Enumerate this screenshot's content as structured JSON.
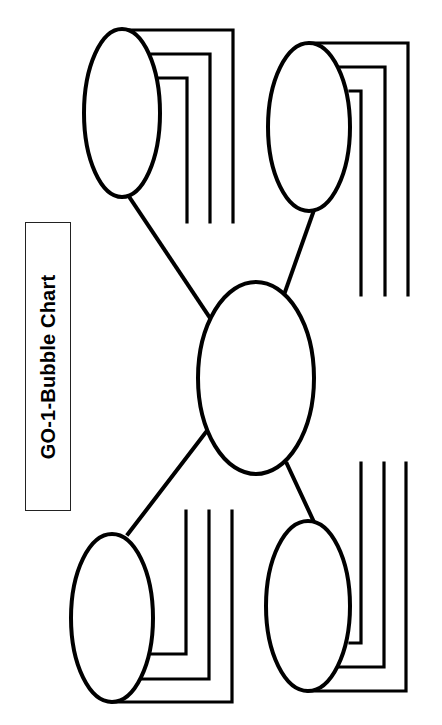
{
  "title": "GO-1-Bubble Chart",
  "colors": {
    "stroke": "#000000",
    "background": "#ffffff"
  },
  "diagram": {
    "type": "bubble-chart",
    "center_bubble": {
      "label": ""
    },
    "outer_bubbles": [
      {
        "position": "top-left",
        "label": "",
        "lines": [
          "",
          "",
          ""
        ]
      },
      {
        "position": "top-right",
        "label": "",
        "lines": [
          "",
          "",
          ""
        ]
      },
      {
        "position": "bottom-left",
        "label": "",
        "lines": [
          "",
          "",
          ""
        ]
      },
      {
        "position": "bottom-right",
        "label": "",
        "lines": [
          "",
          "",
          ""
        ]
      }
    ]
  }
}
